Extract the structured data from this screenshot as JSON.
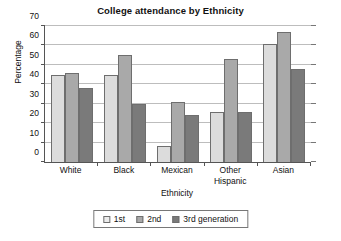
{
  "chart_data": {
    "type": "bar",
    "title": "College attendance by Ethnicity",
    "xlabel": "Ethnicity",
    "ylabel": "Percentage",
    "categories": [
      "White",
      "Black",
      "Mexican",
      "Other Hispanic",
      "Asian"
    ],
    "series": [
      {
        "name": "1st",
        "values": [
          45,
          45,
          8,
          26,
          61
        ]
      },
      {
        "name": "2nd",
        "values": [
          46,
          55,
          31,
          53,
          67
        ]
      },
      {
        "name": "3rd generation",
        "values": [
          38,
          30,
          24,
          26,
          48
        ]
      }
    ],
    "ylim": [
      0,
      70
    ],
    "yticks": [
      0,
      10,
      20,
      30,
      40,
      50,
      60,
      70
    ],
    "ytick_labels": [
      "0",
      "10",
      "20",
      "30",
      "40",
      "50",
      "60",
      "70"
    ],
    "grid": true,
    "legend_position": "bottom-center",
    "colors": {
      "series_1st": "#dcdcdc",
      "series_2nd": "#a9a9a9",
      "series_3rd": "#7a7a7a",
      "bar_edge": "#6e6e6e",
      "axis": "#555555",
      "gridline": "#bdbdbd",
      "background": "#ffffff",
      "text": "#111111"
    }
  }
}
